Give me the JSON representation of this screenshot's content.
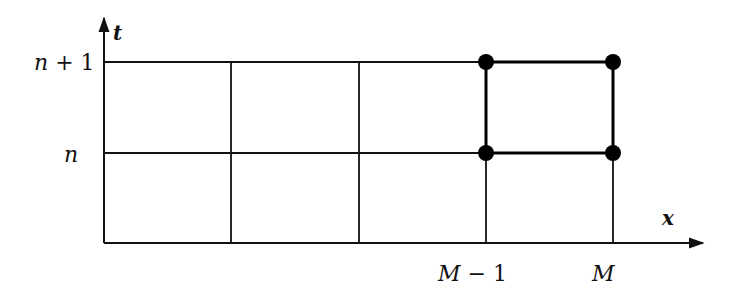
{
  "diagram": {
    "type": "finite-difference-grid",
    "axes": {
      "x_label": "x",
      "t_label": "t"
    },
    "t_ticks": [
      {
        "label_var": "n",
        "label_rest": " + 1",
        "y": 62
      },
      {
        "label_var": "n",
        "label_rest": "",
        "y": 153
      }
    ],
    "x_ticks": [
      {
        "label_var": "M",
        "label_rest": " − 1",
        "x": 486
      },
      {
        "label_var": "M",
        "label_rest": "",
        "x": 613
      }
    ],
    "grid": {
      "vertical_lines_x": [
        104,
        231,
        359,
        486,
        613
      ],
      "horizontal_lines_y": [
        62,
        153,
        243
      ]
    },
    "stencil_points": [
      {
        "x": 486,
        "y": 62
      },
      {
        "x": 613,
        "y": 62
      },
      {
        "x": 486,
        "y": 153
      },
      {
        "x": 613,
        "y": 153
      }
    ],
    "colors": {
      "line": "#111111",
      "point": "#000000",
      "background": "#ffffff"
    }
  }
}
